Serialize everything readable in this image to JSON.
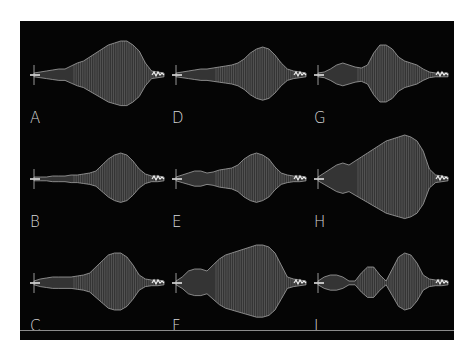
{
  "figure": {
    "background": "#050505",
    "trace_color": "#c8c8c8",
    "panels": [
      {
        "label": "A",
        "row": 0,
        "col": 0
      },
      {
        "label": "D",
        "row": 0,
        "col": 1
      },
      {
        "label": "G",
        "row": 0,
        "col": 2
      },
      {
        "label": "B",
        "row": 1,
        "col": 0
      },
      {
        "label": "E",
        "row": 1,
        "col": 1
      },
      {
        "label": "H",
        "row": 1,
        "col": 2
      },
      {
        "label": "C",
        "row": 2,
        "col": 0
      },
      {
        "label": "F",
        "row": 2,
        "col": 1
      },
      {
        "label": "I",
        "row": 2,
        "col": 2
      }
    ]
  }
}
